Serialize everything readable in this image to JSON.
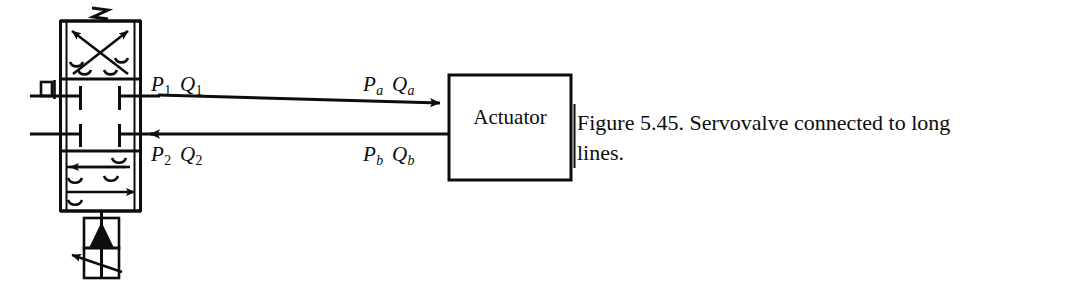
{
  "figure": {
    "caption_line1": "Figure 5.45. Servovalve connected to long",
    "caption_line2": "lines.",
    "caption_full": "Figure 5.45. Servovalve connected to long lines."
  },
  "actuator": {
    "label": "Actuator"
  },
  "ports": {
    "valve_upper": {
      "pressure": "P",
      "pressure_sub": "1",
      "flow": "Q",
      "flow_sub": "1"
    },
    "valve_lower": {
      "pressure": "P",
      "pressure_sub": "2",
      "flow": "Q",
      "flow_sub": "2"
    },
    "actuator_upper": {
      "pressure": "P",
      "pressure_sub": "a",
      "flow": "Q",
      "flow_sub": "a"
    },
    "actuator_lower": {
      "pressure": "P",
      "pressure_sub": "b",
      "flow": "Q",
      "flow_sub": "b"
    }
  },
  "valve": {
    "type": "servovalve",
    "envelopes": 3,
    "top_envelope": "crossed-flow-paths",
    "middle_envelope": "closed-center-blocked-ports",
    "bottom_envelope": "parallel-flow-paths",
    "spring_symbol": "zigzag-spring",
    "actuator_symbol": "solenoid-with-pilot"
  },
  "colors": {
    "ink": "#0d0d0d",
    "background": "#ffffff"
  }
}
